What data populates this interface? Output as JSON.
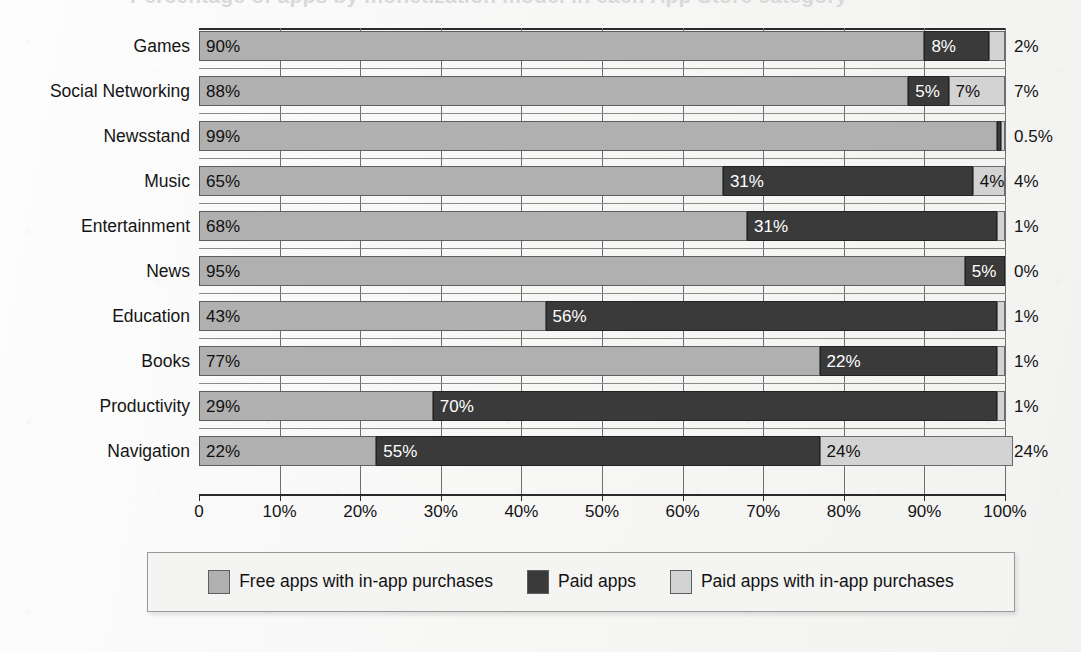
{
  "title_sliver": "Percentage of apps by monetization model in each App Store category",
  "colors": {
    "free_iap": "#b0b0b0",
    "paid": "#3a3a3a",
    "paid_iap": "#d3d3d3",
    "background": "#fbfbfb",
    "axis": "#2a2a2a",
    "grid": "#6e6e6e"
  },
  "legend": {
    "items": [
      {
        "label": "Free apps with in-app purchases",
        "color_key": "free_iap",
        "swatch": "#b0b0b0"
      },
      {
        "label": "Paid apps",
        "color_key": "paid",
        "swatch": "#3a3a3a"
      },
      {
        "label": "Paid apps with in-app purchases",
        "color_key": "paid_iap",
        "swatch": "#d3d3d3"
      }
    ]
  },
  "chart_data": {
    "type": "bar",
    "orientation": "horizontal",
    "stacked": true,
    "stack_mode": "percent",
    "title": "Percentage of apps by monetization model in each App Store category",
    "xlabel": "",
    "ylabel": "",
    "xlim": [
      0,
      100
    ],
    "grid": true,
    "grid_axis": "x",
    "legend_position": "bottom",
    "tick_labels": [
      "0",
      "10%",
      "20%",
      "30%",
      "40%",
      "50%",
      "60%",
      "70%",
      "80%",
      "90%",
      "100%"
    ],
    "tick_values": [
      0,
      10,
      20,
      30,
      40,
      50,
      60,
      70,
      80,
      90,
      100
    ],
    "categories": [
      "Games",
      "Social Networking",
      "Newsstand",
      "Music",
      "Entertainment",
      "News",
      "Education",
      "Books",
      "Productivity",
      "Navigation"
    ],
    "series": [
      {
        "name": "Free apps with in-app purchases",
        "values": [
          90,
          88,
          99,
          65,
          68,
          95,
          43,
          77,
          29,
          22
        ],
        "labels": [
          "90%",
          "88%",
          "99%",
          "65%",
          "68%",
          "95%",
          "43%",
          "77%",
          "29%",
          "22%"
        ]
      },
      {
        "name": "Paid apps",
        "values": [
          8,
          5,
          0.5,
          31,
          31,
          5,
          56,
          22,
          70,
          55
        ],
        "labels": [
          "8%",
          "5%",
          "0.5%",
          "31%",
          "31%",
          "5%",
          "56%",
          "22%",
          "70%",
          "55%"
        ]
      },
      {
        "name": "Paid apps with in-app purchases",
        "values": [
          2,
          7,
          0.5,
          4,
          1,
          0,
          1,
          1,
          1,
          24
        ],
        "labels": [
          "2%",
          "7%",
          "0.5%",
          "4%",
          "1%",
          "0%",
          "1%",
          "1%",
          "1%",
          "24%"
        ]
      }
    ],
    "rows": [
      {
        "category": "Games",
        "free_iap": 90,
        "paid": 8,
        "paid_iap": 2,
        "free_iap_label": "90%",
        "paid_label": "8%",
        "paid_iap_label": "2%"
      },
      {
        "category": "Social Networking",
        "free_iap": 88,
        "paid": 5,
        "paid_iap": 7,
        "free_iap_label": "88%",
        "paid_label": "5%",
        "paid_iap_label": "7%"
      },
      {
        "category": "Newsstand",
        "free_iap": 99,
        "paid": 0.5,
        "paid_iap": 0.5,
        "free_iap_label": "99%",
        "paid_label": "0.5%",
        "paid_iap_label": "0.5%"
      },
      {
        "category": "Music",
        "free_iap": 65,
        "paid": 31,
        "paid_iap": 4,
        "free_iap_label": "65%",
        "paid_label": "31%",
        "paid_iap_label": "4%"
      },
      {
        "category": "Entertainment",
        "free_iap": 68,
        "paid": 31,
        "paid_iap": 1,
        "free_iap_label": "68%",
        "paid_label": "31%",
        "paid_iap_label": "1%"
      },
      {
        "category": "News",
        "free_iap": 95,
        "paid": 5,
        "paid_iap": 0,
        "free_iap_label": "95%",
        "paid_label": "5%",
        "paid_iap_label": "0%"
      },
      {
        "category": "Education",
        "free_iap": 43,
        "paid": 56,
        "paid_iap": 1,
        "free_iap_label": "43%",
        "paid_label": "56%",
        "paid_iap_label": "1%"
      },
      {
        "category": "Books",
        "free_iap": 77,
        "paid": 22,
        "paid_iap": 1,
        "free_iap_label": "77%",
        "paid_label": "22%",
        "paid_iap_label": "1%"
      },
      {
        "category": "Productivity",
        "free_iap": 29,
        "paid": 70,
        "paid_iap": 1,
        "free_iap_label": "29%",
        "paid_label": "70%",
        "paid_iap_label": "1%"
      },
      {
        "category": "Navigation",
        "free_iap": 22,
        "paid": 55,
        "paid_iap": 24,
        "free_iap_label": "22%",
        "paid_label": "55%",
        "paid_iap_label": "24%"
      }
    ]
  }
}
